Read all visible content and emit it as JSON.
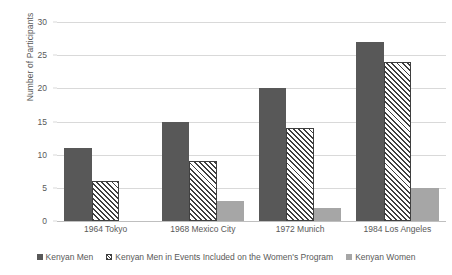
{
  "chart_data": {
    "type": "bar",
    "title": "",
    "xlabel": "",
    "ylabel": "Number of Participants",
    "ylim": [
      0,
      30
    ],
    "ytick_step": 5,
    "yticks": [
      0,
      5,
      10,
      15,
      20,
      25,
      30
    ],
    "grid": true,
    "legend_position": "bottom",
    "categories": [
      "1964 Tokyo",
      "1968 Mexico City",
      "1972 Munich",
      "1984 Los Angeles"
    ],
    "series": [
      {
        "name": "Kenyan Men",
        "values": [
          11,
          15,
          20,
          27
        ],
        "color": "#585858",
        "fill": "solid"
      },
      {
        "name": "Kenyan Men in Events Included on the Women's Program",
        "values": [
          6,
          9,
          14,
          24
        ],
        "color": "#3f3f3f",
        "fill": "diagonal-hatch"
      },
      {
        "name": "Kenyan Women",
        "values": [
          0,
          3,
          2,
          5
        ],
        "color": "#a6a6a6",
        "fill": "solid"
      }
    ]
  },
  "style": {
    "gridline_color": "#d9d9d9",
    "text_color": "#595959",
    "background": "#ffffff"
  }
}
